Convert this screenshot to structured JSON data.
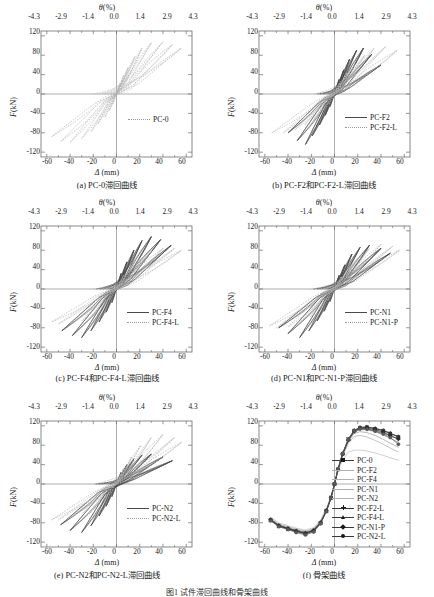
{
  "figure": {
    "n_panels": 6,
    "footer_caption": "图1  试件滞回曲线和骨架曲线"
  },
  "axes": {
    "top_axis_title": "θ(%)",
    "top_axis_symbol": "θ",
    "top_axis_unit": "(%)",
    "bottom_axis_title": "Δ (mm)",
    "bottom_axis_symbol": "Δ",
    "bottom_axis_unit": "(mm)",
    "y_axis_title": "F(kN)",
    "y_axis_symbol": "F",
    "y_axis_unit": "(kN)",
    "top_ticks": [
      "-4.3",
      "-2.9",
      "-1.4",
      "0.0",
      "1.4",
      "2.9",
      "4.3"
    ],
    "top_tick_values": [
      -4.3,
      -2.9,
      -1.4,
      0.0,
      1.4,
      2.9,
      4.3
    ],
    "bottom_ticks": [
      "-60",
      "-40",
      "-20",
      "0",
      "20",
      "40",
      "60"
    ],
    "bottom_tick_values": [
      -60,
      -40,
      -20,
      0,
      20,
      40,
      60
    ],
    "y_ticks": [
      "120",
      "80",
      "40",
      "0",
      "-40",
      "-80",
      "-120"
    ],
    "y_tick_values": [
      120,
      80,
      40,
      0,
      -40,
      -80,
      -120
    ],
    "xlim": [
      -65,
      65
    ],
    "ylim": [
      -130,
      130
    ]
  },
  "panels": [
    {
      "id": "a",
      "caption": "(a) PC-0滞回曲线",
      "legend": [
        {
          "label": "PC-0",
          "style": "dotted",
          "color": "#9a9a9a"
        }
      ]
    },
    {
      "id": "b",
      "caption": "(b) PC-F2和PC-F2-L滞回曲线",
      "legend": [
        {
          "label": "PC-F2",
          "style": "solid",
          "color": "#3a3a3a"
        },
        {
          "label": "PC-F2-L",
          "style": "dotted",
          "color": "#a8a8a8"
        }
      ]
    },
    {
      "id": "c",
      "caption": "(c) PC-F4和PC-F4-L滞回曲线",
      "legend": [
        {
          "label": "PC-F4",
          "style": "solid",
          "color": "#3a3a3a"
        },
        {
          "label": "PC-F4-L",
          "style": "dotted",
          "color": "#a8a8a8"
        }
      ]
    },
    {
      "id": "d",
      "caption": "(d) PC-N1和PC-N1-P滞回曲线",
      "legend": [
        {
          "label": "PC-N1",
          "style": "solid",
          "color": "#3a3a3a"
        },
        {
          "label": "PC-N1-P",
          "style": "dotted",
          "color": "#a8a8a8"
        }
      ]
    },
    {
      "id": "e",
      "caption": "(e) PC-N2和PC-N2-L滞回曲线",
      "legend": [
        {
          "label": "PC-N2",
          "style": "solid",
          "color": "#3a3a3a"
        },
        {
          "label": "PC-N2-L",
          "style": "dotted",
          "color": "#a8a8a8"
        }
      ]
    },
    {
      "id": "f",
      "caption": "(f) 骨架曲线",
      "legend": [
        {
          "label": "PC-0",
          "style": "line-marker",
          "marker": "square",
          "color": "#1a1a1a"
        },
        {
          "label": "PC-F2",
          "style": "solid",
          "marker": "none",
          "color": "#8a8a8a"
        },
        {
          "label": "PC-F4",
          "style": "solid",
          "marker": "none",
          "color": "#7a7a7a"
        },
        {
          "label": "PC-N1",
          "style": "solid",
          "marker": "none",
          "color": "#9a9a9a"
        },
        {
          "label": "PC-N2",
          "style": "solid",
          "marker": "none",
          "color": "#b0b0b0"
        },
        {
          "label": "PC-F2-L",
          "style": "line-marker",
          "marker": "plus",
          "color": "#6a6a6a"
        },
        {
          "label": "PC-F4-L",
          "style": "line-marker",
          "marker": "triangle",
          "color": "#3a3a3a"
        },
        {
          "label": "PC-N1-P",
          "style": "line-marker",
          "marker": "diamond",
          "color": "#2a2a2a"
        },
        {
          "label": "PC-N2-L",
          "style": "line-marker",
          "marker": "circle",
          "color": "#5a5a5a"
        }
      ]
    }
  ],
  "chart_data": [
    {
      "type": "line",
      "panel": "a",
      "title": "(a) PC-0滞回曲线",
      "xlabel": "Δ (mm)",
      "ylabel": "F(kN)",
      "xlim": [
        -65,
        65
      ],
      "ylim": [
        -130,
        130
      ],
      "grid": false,
      "legend_position": "lower-right",
      "series": [
        {
          "name": "PC-0",
          "style": "dotted",
          "loops": [
            {
              "amplitude_mm": 3,
              "peak_pos_kN": 22,
              "peak_neg_kN": -20
            },
            {
              "amplitude_mm": 6,
              "peak_pos_kN": 38,
              "peak_neg_kN": -34
            },
            {
              "amplitude_mm": 10,
              "peak_pos_kN": 55,
              "peak_neg_kN": -48
            },
            {
              "amplitude_mm": 16,
              "peak_pos_kN": 78,
              "peak_neg_kN": -62
            },
            {
              "amplitude_mm": 22,
              "peak_pos_kN": 95,
              "peak_neg_kN": -78
            },
            {
              "amplitude_mm": 30,
              "peak_pos_kN": 106,
              "peak_neg_kN": -92
            },
            {
              "amplitude_mm": 40,
              "peak_pos_kN": 108,
              "peak_neg_kN": -100
            },
            {
              "amplitude_mm": 48,
              "peak_pos_kN": 102,
              "peak_neg_kN": -98
            },
            {
              "amplitude_mm": 56,
              "peak_pos_kN": 95,
              "peak_neg_kN": -88
            }
          ]
        }
      ]
    },
    {
      "type": "line",
      "panel": "b",
      "title": "(b) PC-F2和PC-F2-L滞回曲线",
      "xlabel": "Δ (mm)",
      "ylabel": "F(kN)",
      "xlim": [
        -65,
        65
      ],
      "ylim": [
        -130,
        130
      ],
      "grid": false,
      "legend_position": "lower-right",
      "series": [
        {
          "name": "PC-F2",
          "style": "solid",
          "loops": [
            {
              "amplitude_mm": 4,
              "peak_pos_kN": 30,
              "peak_neg_kN": -26
            },
            {
              "amplitude_mm": 8,
              "peak_pos_kN": 50,
              "peak_neg_kN": -44
            },
            {
              "amplitude_mm": 13,
              "peak_pos_kN": 72,
              "peak_neg_kN": -64
            },
            {
              "amplitude_mm": 19,
              "peak_pos_kN": 90,
              "peak_neg_kN": -86
            },
            {
              "amplitude_mm": 25,
              "peak_pos_kN": 95,
              "peak_neg_kN": -104
            },
            {
              "amplitude_mm": 32,
              "peak_pos_kN": 82,
              "peak_neg_kN": -96
            },
            {
              "amplitude_mm": 40,
              "peak_pos_kN": 60,
              "peak_neg_kN": -80
            }
          ]
        },
        {
          "name": "PC-F2-L",
          "style": "dotted",
          "loops": [
            {
              "amplitude_mm": 5,
              "peak_pos_kN": 26,
              "peak_neg_kN": -22
            },
            {
              "amplitude_mm": 11,
              "peak_pos_kN": 44,
              "peak_neg_kN": -38
            },
            {
              "amplitude_mm": 18,
              "peak_pos_kN": 62,
              "peak_neg_kN": -52
            },
            {
              "amplitude_mm": 26,
              "peak_pos_kN": 80,
              "peak_neg_kN": -64
            },
            {
              "amplitude_mm": 34,
              "peak_pos_kN": 94,
              "peak_neg_kN": -74
            },
            {
              "amplitude_mm": 44,
              "peak_pos_kN": 98,
              "peak_neg_kN": -80
            },
            {
              "amplitude_mm": 54,
              "peak_pos_kN": 90,
              "peak_neg_kN": -80
            }
          ]
        }
      ]
    },
    {
      "type": "line",
      "panel": "c",
      "title": "(c) PC-F4和PC-F4-L滞回曲线",
      "xlabel": "Δ (mm)",
      "ylabel": "F(kN)",
      "xlim": [
        -65,
        65
      ],
      "ylim": [
        -130,
        130
      ],
      "grid": false,
      "legend_position": "lower-right",
      "series": [
        {
          "name": "PC-F4",
          "style": "solid",
          "loops": [
            {
              "amplitude_mm": 4,
              "peak_pos_kN": 32,
              "peak_neg_kN": -28
            },
            {
              "amplitude_mm": 9,
              "peak_pos_kN": 56,
              "peak_neg_kN": -48
            },
            {
              "amplitude_mm": 15,
              "peak_pos_kN": 80,
              "peak_neg_kN": -68
            },
            {
              "amplitude_mm": 22,
              "peak_pos_kN": 100,
              "peak_neg_kN": -86
            },
            {
              "amplitude_mm": 30,
              "peak_pos_kN": 108,
              "peak_neg_kN": -100
            },
            {
              "amplitude_mm": 38,
              "peak_pos_kN": 102,
              "peak_neg_kN": -96
            },
            {
              "amplitude_mm": 47,
              "peak_pos_kN": 90,
              "peak_neg_kN": -86
            }
          ]
        },
        {
          "name": "PC-F4-L",
          "style": "dotted",
          "loops": [
            {
              "amplitude_mm": 6,
              "peak_pos_kN": 28,
              "peak_neg_kN": -22
            },
            {
              "amplitude_mm": 13,
              "peak_pos_kN": 48,
              "peak_neg_kN": -40
            },
            {
              "amplitude_mm": 21,
              "peak_pos_kN": 66,
              "peak_neg_kN": -56
            },
            {
              "amplitude_mm": 30,
              "peak_pos_kN": 78,
              "peak_neg_kN": -66
            },
            {
              "amplitude_mm": 40,
              "peak_pos_kN": 84,
              "peak_neg_kN": -72
            },
            {
              "amplitude_mm": 50,
              "peak_pos_kN": 84,
              "peak_neg_kN": -72
            },
            {
              "amplitude_mm": 56,
              "peak_pos_kN": 80,
              "peak_neg_kN": -68
            }
          ]
        }
      ]
    },
    {
      "type": "line",
      "panel": "d",
      "title": "(d) PC-N1和PC-N1-P滞回曲线",
      "xlabel": "Δ (mm)",
      "ylabel": "F(kN)",
      "xlim": [
        -65,
        65
      ],
      "ylim": [
        -130,
        130
      ],
      "grid": false,
      "legend_position": "lower-right",
      "series": [
        {
          "name": "PC-N1",
          "style": "solid",
          "loops": [
            {
              "amplitude_mm": 4,
              "peak_pos_kN": 28,
              "peak_neg_kN": -26
            },
            {
              "amplitude_mm": 9,
              "peak_pos_kN": 50,
              "peak_neg_kN": -46
            },
            {
              "amplitude_mm": 15,
              "peak_pos_kN": 72,
              "peak_neg_kN": -66
            },
            {
              "amplitude_mm": 22,
              "peak_pos_kN": 86,
              "peak_neg_kN": -86
            },
            {
              "amplitude_mm": 30,
              "peak_pos_kN": 90,
              "peak_neg_kN": -100
            },
            {
              "amplitude_mm": 40,
              "peak_pos_kN": 84,
              "peak_neg_kN": -92
            },
            {
              "amplitude_mm": 48,
              "peak_pos_kN": 74,
              "peak_neg_kN": -80
            }
          ]
        },
        {
          "name": "PC-N1-P",
          "style": "dotted",
          "loops": [
            {
              "amplitude_mm": 6,
              "peak_pos_kN": 26,
              "peak_neg_kN": -24
            },
            {
              "amplitude_mm": 13,
              "peak_pos_kN": 46,
              "peak_neg_kN": -42
            },
            {
              "amplitude_mm": 21,
              "peak_pos_kN": 66,
              "peak_neg_kN": -58
            },
            {
              "amplitude_mm": 30,
              "peak_pos_kN": 84,
              "peak_neg_kN": -70
            },
            {
              "amplitude_mm": 40,
              "peak_pos_kN": 92,
              "peak_neg_kN": -78
            },
            {
              "amplitude_mm": 50,
              "peak_pos_kN": 88,
              "peak_neg_kN": -80
            },
            {
              "amplitude_mm": 56,
              "peak_pos_kN": 80,
              "peak_neg_kN": -76
            }
          ]
        }
      ]
    },
    {
      "type": "line",
      "panel": "e",
      "title": "(e) PC-N2和PC-N2-L滞回曲线",
      "xlabel": "Δ (mm)",
      "ylabel": "F(kN)",
      "xlim": [
        -65,
        65
      ],
      "ylim": [
        -130,
        130
      ],
      "grid": false,
      "legend_position": "lower-right",
      "series": [
        {
          "name": "PC-N2",
          "style": "solid",
          "loops": [
            {
              "amplitude_mm": 4,
              "peak_pos_kN": 24,
              "peak_neg_kN": -26
            },
            {
              "amplitude_mm": 9,
              "peak_pos_kN": 40,
              "peak_neg_kN": -46
            },
            {
              "amplitude_mm": 15,
              "peak_pos_kN": 52,
              "peak_neg_kN": -66
            },
            {
              "amplitude_mm": 22,
              "peak_pos_kN": 60,
              "peak_neg_kN": -86
            },
            {
              "amplitude_mm": 30,
              "peak_pos_kN": 62,
              "peak_neg_kN": -100
            },
            {
              "amplitude_mm": 40,
              "peak_pos_kN": 56,
              "peak_neg_kN": -96
            },
            {
              "amplitude_mm": 48,
              "peak_pos_kN": 48,
              "peak_neg_kN": -84
            }
          ]
        },
        {
          "name": "PC-N2-L",
          "style": "dotted",
          "loops": [
            {
              "amplitude_mm": 6,
              "peak_pos_kN": 32,
              "peak_neg_kN": -22
            },
            {
              "amplitude_mm": 13,
              "peak_pos_kN": 56,
              "peak_neg_kN": -38
            },
            {
              "amplitude_mm": 21,
              "peak_pos_kN": 80,
              "peak_neg_kN": -52
            },
            {
              "amplitude_mm": 30,
              "peak_pos_kN": 96,
              "peak_neg_kN": -62
            },
            {
              "amplitude_mm": 40,
              "peak_pos_kN": 102,
              "peak_neg_kN": -70
            },
            {
              "amplitude_mm": 50,
              "peak_pos_kN": 96,
              "peak_neg_kN": -74
            },
            {
              "amplitude_mm": 56,
              "peak_pos_kN": 86,
              "peak_neg_kN": -74
            }
          ]
        }
      ]
    },
    {
      "type": "line",
      "panel": "f",
      "title": "(f) 骨架曲线",
      "xlabel": "Δ (mm)",
      "ylabel": "F(kN)",
      "xlim": [
        -65,
        65
      ],
      "ylim": [
        -130,
        130
      ],
      "grid": false,
      "legend_position": "right-center",
      "x": [
        -55,
        -48,
        -40,
        -33,
        -25,
        -18,
        -12,
        -7,
        -3,
        0,
        3,
        7,
        12,
        17,
        22,
        28,
        35,
        42,
        48,
        55
      ],
      "series": [
        {
          "name": "PC-0",
          "marker": "square",
          "values": [
            -74,
            -86,
            -92,
            -97,
            -101,
            -96,
            -80,
            -55,
            -28,
            0,
            30,
            62,
            92,
            110,
            116,
            117,
            114,
            110,
            104,
            97
          ]
        },
        {
          "name": "PC-F2",
          "marker": "none",
          "values": [
            -72,
            -84,
            -90,
            -95,
            -99,
            -94,
            -78,
            -54,
            -27,
            0,
            29,
            60,
            88,
            104,
            108,
            106,
            100,
            92,
            84,
            76
          ]
        },
        {
          "name": "PC-F4",
          "marker": "none",
          "values": [
            -73,
            -85,
            -91,
            -96,
            -100,
            -95,
            -79,
            -55,
            -28,
            0,
            30,
            61,
            90,
            107,
            112,
            112,
            108,
            101,
            94,
            86
          ]
        },
        {
          "name": "PC-N1",
          "marker": "none",
          "values": [
            -70,
            -82,
            -88,
            -93,
            -97,
            -92,
            -76,
            -52,
            -26,
            0,
            28,
            57,
            84,
            98,
            100,
            97,
            90,
            82,
            74,
            66
          ]
        },
        {
          "name": "PC-N2",
          "marker": "none",
          "values": [
            -68,
            -80,
            -86,
            -91,
            -95,
            -90,
            -74,
            -50,
            -25,
            0,
            26,
            50,
            66,
            70,
            70,
            68,
            64,
            59,
            54,
            49
          ]
        },
        {
          "name": "PC-F2-L",
          "marker": "plus",
          "values": [
            -73,
            -85,
            -91,
            -96,
            -100,
            -95,
            -79,
            -55,
            -28,
            0,
            30,
            61,
            90,
            108,
            113,
            113,
            110,
            105,
            99,
            92
          ]
        },
        {
          "name": "PC-F4-L",
          "marker": "triangle",
          "values": [
            -75,
            -87,
            -93,
            -98,
            -103,
            -97,
            -81,
            -56,
            -29,
            0,
            31,
            63,
            93,
            111,
            117,
            118,
            115,
            111,
            105,
            98
          ]
        },
        {
          "name": "PC-N1-P",
          "marker": "diamond",
          "values": [
            -74,
            -86,
            -92,
            -97,
            -102,
            -96,
            -80,
            -55,
            -28,
            0,
            30,
            62,
            91,
            109,
            115,
            115,
            112,
            107,
            100,
            93
          ]
        },
        {
          "name": "PC-N2-L",
          "marker": "circle",
          "values": [
            -76,
            -88,
            -94,
            -100,
            -105,
            -99,
            -82,
            -57,
            -29,
            0,
            31,
            63,
            92,
            110,
            114,
            113,
            109,
            103,
            96,
            82
          ]
        }
      ]
    }
  ]
}
